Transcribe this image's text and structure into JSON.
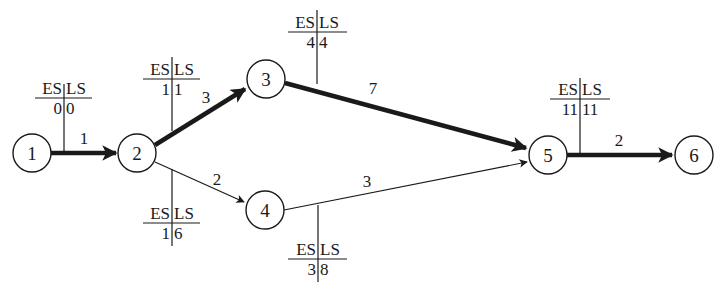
{
  "diagram": {
    "type": "activity-on-node network (critical path)",
    "colors": {
      "stroke": "#1a1a1a",
      "background": "#ffffff"
    },
    "nodes": [
      {
        "id": "1",
        "label": "1",
        "cx": 32,
        "cy": 153
      },
      {
        "id": "2",
        "label": "2",
        "cx": 137,
        "cy": 153
      },
      {
        "id": "3",
        "label": "3",
        "cx": 266,
        "cy": 79
      },
      {
        "id": "4",
        "label": "4",
        "cx": 265,
        "cy": 210
      },
      {
        "id": "5",
        "label": "5",
        "cx": 548,
        "cy": 155
      },
      {
        "id": "6",
        "label": "6",
        "cx": 694,
        "cy": 155
      }
    ],
    "edges": [
      {
        "from": "1",
        "to": "2",
        "duration": "1",
        "critical": true
      },
      {
        "from": "2",
        "to": "3",
        "duration": "3",
        "critical": true
      },
      {
        "from": "2",
        "to": "4",
        "duration": "2",
        "critical": false
      },
      {
        "from": "3",
        "to": "5",
        "duration": "7",
        "critical": true
      },
      {
        "from": "4",
        "to": "5",
        "duration": "3",
        "critical": false
      },
      {
        "from": "5",
        "to": "6",
        "duration": "2",
        "critical": true
      }
    ],
    "es_ls_tables": [
      {
        "node": "1",
        "header_es": "ES",
        "header_ls": "LS",
        "es": "0",
        "ls": "0",
        "position": "above"
      },
      {
        "node": "2",
        "header_es": "ES",
        "header_ls": "LS",
        "es": "1",
        "ls": "1",
        "position": "above"
      },
      {
        "node": "3",
        "header_es": "ES",
        "header_ls": "LS",
        "es": "4",
        "ls": "4",
        "position": "above"
      },
      {
        "node": "4",
        "header_es": "ES",
        "header_ls": "LS",
        "es": "3",
        "ls": "8",
        "position": "below"
      },
      {
        "node": "2b",
        "header_es": "ES",
        "header_ls": "LS",
        "es": "1",
        "ls": "6",
        "position": "below"
      },
      {
        "node": "5",
        "header_es": "ES",
        "header_ls": "LS",
        "es": "11",
        "ls": "11",
        "position": "above"
      }
    ]
  }
}
